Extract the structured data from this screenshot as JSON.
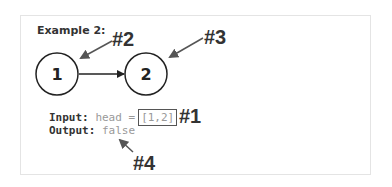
{
  "example": {
    "title": "Example 2:",
    "nodes": [
      {
        "label": "1"
      },
      {
        "label": "2"
      }
    ],
    "input": {
      "key": "Input:",
      "expression": "head =",
      "value": "[1,2]"
    },
    "output": {
      "key": "Output:",
      "value": "false"
    }
  },
  "annotations": {
    "marker1": "#1",
    "marker2": "#2",
    "marker3": "#3",
    "marker4": "#4"
  },
  "colors": {
    "ink": "#333333",
    "muted": "#999999",
    "border": "#e4e4e4"
  }
}
